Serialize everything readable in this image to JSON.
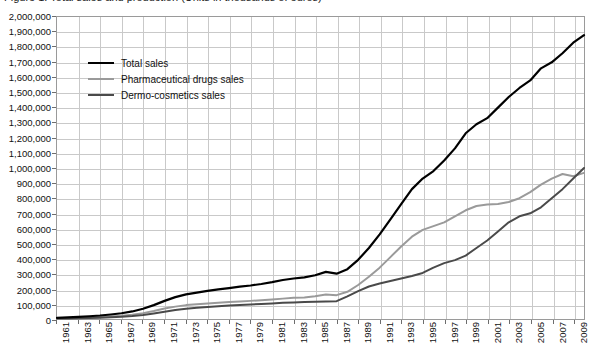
{
  "figure": {
    "title": "Figure 1. Total sales and production (Units in thousands of euros)"
  },
  "legend": {
    "position": "top-left-inside",
    "items": [
      {
        "label": "Total sales",
        "color": "#000000",
        "width": 2.2
      },
      {
        "label": "Pharmaceutical drugs sales",
        "color": "#9a9a9a",
        "width": 2.0
      },
      {
        "label": "Dermo-cosmetics sales",
        "color": "#4a4a4a",
        "width": 2.0
      }
    ]
  },
  "axes": {
    "y_ticks": [
      "2,000,000",
      "1,900,000",
      "1,800,000",
      "1,700,000",
      "1,600,000",
      "1,500,000",
      "1,400,000",
      "1,300,000",
      "1,200,000",
      "1,100,000",
      "1,000,000",
      "900,000",
      "800,000",
      "700,000",
      "600,000",
      "500,000",
      "400,000",
      "300,000",
      "200,000",
      "100,000",
      "0"
    ],
    "x_ticks": [
      "1961",
      "1963",
      "1965",
      "1967",
      "1969",
      "1971",
      "1973",
      "1975",
      "1977",
      "1979",
      "1981",
      "1983",
      "1985",
      "1987",
      "1989",
      "1991",
      "1993",
      "1995",
      "1997",
      "1999",
      "2001",
      "2003",
      "2005",
      "2007",
      "2009"
    ],
    "grid": true,
    "grid_color": "#c9c9c9",
    "border_color": "#9a9a9a"
  },
  "chart_data": {
    "type": "line",
    "title": "Figure 1. Total sales and production (Units in thousands of euros)",
    "xlabel": "",
    "ylabel": "",
    "ylim": [
      0,
      2000000
    ],
    "xlim": [
      1961,
      2010
    ],
    "ytick_step": 100000,
    "xtick_step": 2,
    "grid": true,
    "legend_position": "upper-left-inside",
    "x": [
      1961,
      1962,
      1963,
      1964,
      1965,
      1966,
      1967,
      1968,
      1969,
      1970,
      1971,
      1972,
      1973,
      1974,
      1975,
      1976,
      1977,
      1978,
      1979,
      1980,
      1981,
      1982,
      1983,
      1984,
      1985,
      1986,
      1987,
      1988,
      1989,
      1990,
      1991,
      1992,
      1993,
      1994,
      1995,
      1996,
      1997,
      1998,
      1999,
      2000,
      2001,
      2002,
      2003,
      2004,
      2005,
      2006,
      2007,
      2008,
      2009,
      2010
    ],
    "series": [
      {
        "name": "Total sales",
        "color": "#000000",
        "values": [
          8000,
          11000,
          14000,
          18000,
          23000,
          30000,
          38000,
          50000,
          68000,
          92000,
          120000,
          145000,
          163000,
          175000,
          186000,
          196000,
          205000,
          214000,
          222000,
          232000,
          244000,
          258000,
          268000,
          276000,
          290000,
          312000,
          300000,
          330000,
          392000,
          470000,
          560000,
          660000,
          760000,
          860000,
          930000,
          980000,
          1050000,
          1130000,
          1230000,
          1290000,
          1330000,
          1400000,
          1470000,
          1530000,
          1580000,
          1660000,
          1700000,
          1760000,
          1830000,
          1880000
        ]
      },
      {
        "name": "Pharmaceutical drugs sales",
        "color": "#9a9a9a",
        "values": [
          4000,
          6000,
          8000,
          10000,
          13000,
          17000,
          22000,
          29000,
          39000,
          53000,
          70000,
          82000,
          92000,
          98000,
          103000,
          108000,
          112000,
          116000,
          120000,
          124000,
          129000,
          135000,
          140000,
          143000,
          150000,
          162000,
          158000,
          180000,
          225000,
          280000,
          340000,
          410000,
          480000,
          545000,
          590000,
          615000,
          640000,
          680000,
          720000,
          748000,
          758000,
          762000,
          775000,
          800000,
          840000,
          890000,
          930000,
          960000,
          945000,
          968000
        ]
      },
      {
        "name": "Dermo-cosmetics sales",
        "color": "#4a4a4a",
        "values": [
          3000,
          4000,
          5000,
          7000,
          9000,
          12000,
          15000,
          20000,
          27000,
          37000,
          48000,
          60000,
          68000,
          74000,
          80000,
          85000,
          89000,
          93000,
          96000,
          100000,
          103000,
          107000,
          110000,
          112000,
          114000,
          116000,
          118000,
          150000,
          185000,
          215000,
          235000,
          252000,
          268000,
          285000,
          305000,
          340000,
          370000,
          390000,
          420000,
          470000,
          520000,
          580000,
          640000,
          680000,
          700000,
          740000,
          800000,
          860000,
          930000,
          1000000
        ]
      }
    ]
  }
}
